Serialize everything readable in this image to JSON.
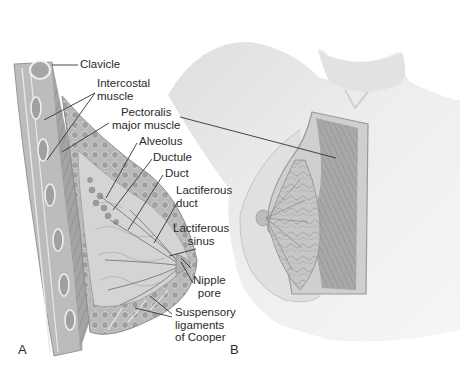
{
  "figure": {
    "panels": [
      {
        "id": "A",
        "letter": "A",
        "view": "sagittal section"
      },
      {
        "id": "B",
        "letter": "B",
        "view": "anterior cutaway"
      }
    ],
    "labels": {
      "clavicle": "Clavicle",
      "intercostal_1": "Intercostal",
      "intercostal_2": "muscle",
      "pectoralis_1": "Pectoralis",
      "pectoralis_2": "major muscle",
      "alveolus": "Alveolus",
      "ductule": "Ductule",
      "duct": "Duct",
      "lactiferous_duct_1": "Lactiferous",
      "lactiferous_duct_2": "duct",
      "lactiferous_sinus_1": "Lactiferous",
      "lactiferous_sinus_2": "sinus",
      "nipple_pore_1": "Nipple",
      "nipple_pore_2": "pore",
      "cooper_1": "Suspensory",
      "cooper_2": "ligaments",
      "cooper_3": "of Cooper"
    },
    "colors": {
      "text": "#2a2a2a",
      "leader_line": "#333333",
      "skin": "#e6e6e6",
      "muscle": "#9a9a9a",
      "gland": "#c8c8c8"
    }
  }
}
